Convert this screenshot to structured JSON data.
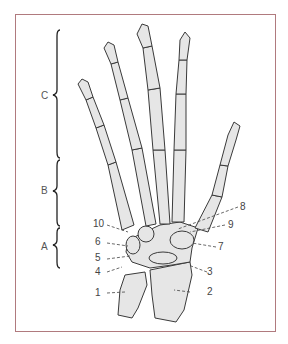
{
  "figure": {
    "border_color": "#b07a7e",
    "bone_fill": "#e4e4e4",
    "bone_stroke": "#3a3a3a"
  },
  "sections": [
    {
      "letter": "C",
      "region": "phalanges"
    },
    {
      "letter": "B",
      "region": "metacarpals"
    },
    {
      "letter": "A",
      "region": "carpals"
    }
  ],
  "labels": [
    {
      "number": "1"
    },
    {
      "number": "2"
    },
    {
      "number": "3"
    },
    {
      "number": "4"
    },
    {
      "number": "5"
    },
    {
      "number": "6"
    },
    {
      "number": "7"
    },
    {
      "number": "8"
    },
    {
      "number": "9"
    },
    {
      "number": "10"
    }
  ]
}
